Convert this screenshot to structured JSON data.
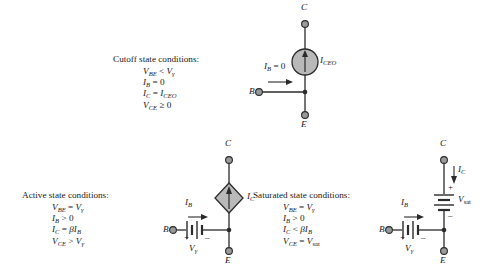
{
  "figure": {
    "stroke_color": "#2b2b2b",
    "node_fill": "#9a9a9a",
    "source_fill": "#b9b9b9"
  },
  "cutoff": {
    "heading": "Cutoff state conditions:",
    "conditions": [
      {
        "lhs": "V",
        "lhs_sub": "BE",
        "op": "<",
        "rhs": "V",
        "rhs_sub": "γ"
      },
      {
        "lhs": "I",
        "lhs_sub": "B",
        "op": "=",
        "rhs": "0",
        "rhs_sub": ""
      },
      {
        "lhs": "I",
        "lhs_sub": "C",
        "op": "=",
        "rhs": "I",
        "rhs_sub": "CEO"
      },
      {
        "lhs": "V",
        "lhs_sub": "CE",
        "op": "≥",
        "rhs": "0",
        "rhs_sub": ""
      }
    ],
    "circuit": {
      "terminal_c": "C",
      "terminal_e": "E",
      "terminal_b": "B",
      "source_label": "I",
      "source_label_sub": "CEO",
      "base_current_label": "I",
      "base_current_sub": "B",
      "base_current_value": "= 0",
      "source_type": "independent-current-source",
      "source_arrow": "up"
    }
  },
  "active": {
    "heading": "Active state conditions:",
    "conditions": [
      {
        "lhs": "V",
        "lhs_sub": "BE",
        "op": "=",
        "rhs": "V",
        "rhs_sub": "γ"
      },
      {
        "lhs": "I",
        "lhs_sub": "B",
        "op": ">",
        "rhs": "0",
        "rhs_sub": ""
      },
      {
        "lhs": "I",
        "lhs_sub": "C",
        "op": "=",
        "rhs": "βI",
        "rhs_sub": "B"
      },
      {
        "lhs": "V",
        "lhs_sub": "CE",
        "op": ">",
        "rhs": "V",
        "rhs_sub": "γ"
      }
    ],
    "circuit": {
      "terminal_c": "C",
      "terminal_e": "E",
      "terminal_b": "B",
      "source_label": "I",
      "source_label_sub": "C",
      "base_current_label": "I",
      "base_current_sub": "B",
      "battery_label": "V",
      "battery_sub": "γ",
      "battery_plus": "+",
      "battery_minus": "–",
      "source_type": "dependent-current-source",
      "source_arrow": "up"
    }
  },
  "saturated": {
    "heading": "Saturated state conditions:",
    "conditions": [
      {
        "lhs": "V",
        "lhs_sub": "BE",
        "op": "=",
        "rhs": "V",
        "rhs_sub": "γ"
      },
      {
        "lhs": "I",
        "lhs_sub": "B",
        "op": ">",
        "rhs": "0",
        "rhs_sub": ""
      },
      {
        "lhs": "I",
        "lhs_sub": "C",
        "op": "<",
        "rhs": "βI",
        "rhs_sub": "B"
      },
      {
        "lhs": "V",
        "lhs_sub": "CE",
        "op": "=",
        "rhs": "V",
        "rhs_sub": "sat"
      }
    ],
    "circuit": {
      "terminal_c": "C",
      "terminal_e": "E",
      "terminal_b": "B",
      "collector_current_label": "I",
      "collector_current_sub": "C",
      "base_current_label": "I",
      "base_current_sub": "B",
      "ce_battery_label": "V",
      "ce_battery_sub": "sat",
      "ce_battery_plus": "+",
      "ce_battery_minus": "–",
      "be_battery_label": "V",
      "be_battery_sub": "γ",
      "be_battery_plus": "+",
      "be_battery_minus": "–"
    }
  }
}
